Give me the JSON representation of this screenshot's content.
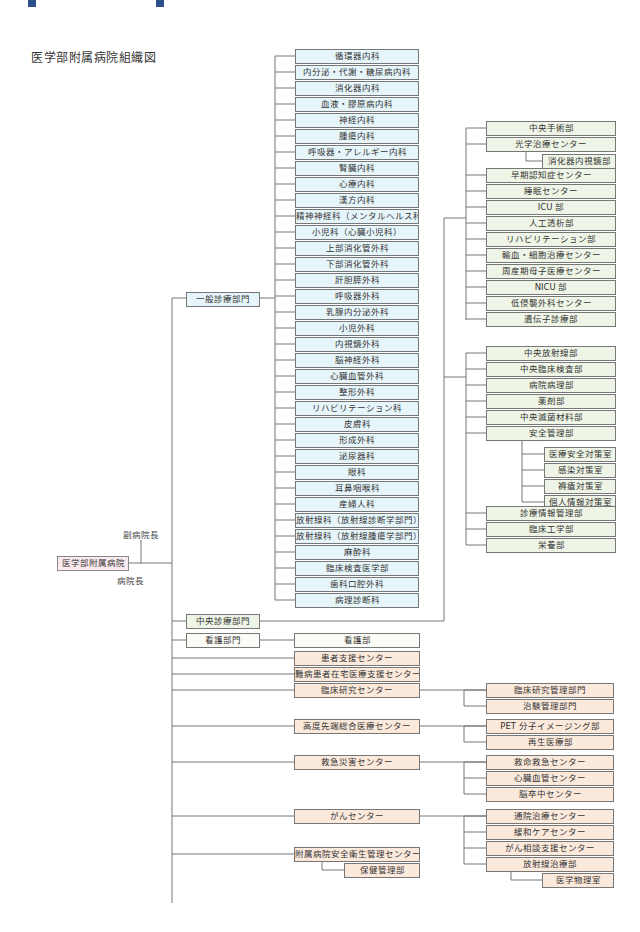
{
  "banner": {
    "title": "病院組織図"
  },
  "page_title": "医学部附属病院組織図",
  "root": {
    "label": "医学部附属病院",
    "deputy": "副病院長",
    "director": "病院長"
  },
  "divisions": {
    "general": "一般診療部門",
    "central": "中央診療部門",
    "nursing": "看護部門"
  },
  "general_departments": [
    "循環器内科",
    "内分泌・代謝・糖尿病内科",
    "消化器内科",
    "血液・膠原病内科",
    "神経内科",
    "腫瘍内科",
    "呼吸器・アレルギー内科",
    "腎臓内科",
    "心療内科",
    "漢方内科",
    "精神神経科（メンタルヘルス科）",
    "小児科（心臓小児科）",
    "上部消化管外科",
    "下部消化管外科",
    "肝胆膵外科",
    "呼吸器外科",
    "乳腺内分泌外科",
    "小児外科",
    "内視鏡外科",
    "脳神経外科",
    "心臓血管外科",
    "整形外科",
    "リハビリテーション科",
    "皮膚科",
    "形成外科",
    "泌尿器科",
    "眼科",
    "耳鼻咽喉科",
    "産婦人科",
    "放射線科（放射線診断学部門）",
    "放射線科（放射線腫瘍学部門）",
    "麻酔科",
    "臨床検査医学部",
    "歯科口腔外科",
    "病理診断科"
  ],
  "central_group1": {
    "surgery": "中央手術部",
    "optical": "光学治療センター",
    "optical_sub": "消化器内視鏡部",
    "items": [
      "早期認知症センター",
      "睡眠センター",
      "ICU 部",
      "人工透析部",
      "リハビリテーション部",
      "輸血・細胞治療センター",
      "周産期母子医療センター",
      "NICU 部",
      "低侵襲外科センター",
      "遺伝子診療部"
    ]
  },
  "central_group2": {
    "items_before": [
      "中央放射線部",
      "中央臨床検査部",
      "病院病理部",
      "薬剤部",
      "中央滅菌材料部",
      "安全管理部"
    ],
    "safety_sub": [
      "医療安全対策室",
      "感染対策室",
      "褥瘡対策室",
      "個人情報対策室"
    ],
    "items_after": [
      "診療情報管理部",
      "臨床工学部",
      "栄養部"
    ]
  },
  "nursing_dept": "看護部",
  "centers": {
    "patient_support": "患者支援センター",
    "intractable": "難病患者在宅医療支援センター",
    "clinical_research": "臨床研究センター",
    "clinical_research_sub": [
      "臨床研究管理部門",
      "治験管理部門"
    ],
    "advanced": "高度先端総合医療センター",
    "advanced_sub": [
      "PET 分子イメージング部",
      "再生医療部"
    ],
    "emergency": "救急災害センター",
    "emergency_sub": [
      "救命救急センター",
      "心臓血管センター",
      "脳卒中センター"
    ],
    "cancer": "がんセンター",
    "cancer_sub": [
      "通院治療センター",
      "緩和ケアセンター",
      "がん相談支援センター",
      "放射線治療部"
    ],
    "cancer_sub2": "医学物理室",
    "safety_health": "附属病院安全衛生管理センター",
    "safety_health_sub": "保健管理部"
  },
  "colors": {
    "general": "#e6f5fa",
    "central": "#eef5e6",
    "centers": "#fbe9dc",
    "root": "#fbeaee",
    "banner": "#2f4f8f"
  }
}
